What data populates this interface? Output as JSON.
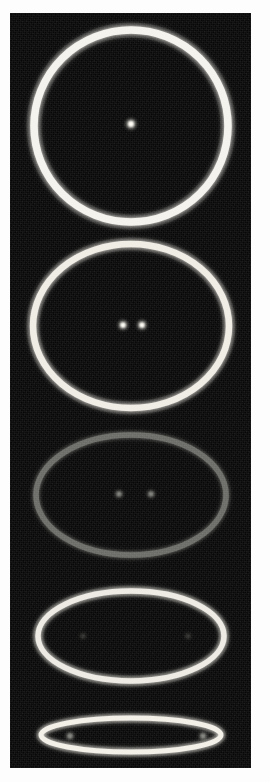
{
  "figure": {
    "kind": "photographic-plate",
    "panel_count": 5,
    "plate": {
      "x": 10,
      "y": 13,
      "width": 241,
      "height": 755,
      "background_color": "#070707",
      "border_color": "#101010",
      "page_color": "#fdfdfd"
    },
    "colors": {
      "bright_curve": "#f4f2ec",
      "dim_curve": "#8b8b86",
      "faint_curve": "#5d5d59",
      "bright_marker": "#fffdf4",
      "dim_marker": "#9a9a94",
      "faint_marker": "#4e4e4a",
      "plate_black": "#070707"
    }
  },
  "chart_data": {
    "type": "scatter",
    "title": "",
    "xlabel": "",
    "ylabel": "",
    "grid": false,
    "legend": null,
    "series": [
      {
        "name": "panel-1-circle",
        "shape": "circle",
        "eccentricity": 0.0,
        "center": [
          131,
          126
        ],
        "rx": 97,
        "ry": 96,
        "stroke_width": 7.5,
        "brightness": "bright",
        "curve_color": "#f4f2ec",
        "markers": [
          {
            "label": "center",
            "x": 131,
            "y": 124,
            "r": 3.4,
            "brightness": "bright"
          }
        ]
      },
      {
        "name": "panel-2-ellipse-low-e",
        "shape": "ellipse",
        "eccentricity": 0.55,
        "center": [
          131,
          326
        ],
        "rx": 98,
        "ry": 82,
        "stroke_width": 6.5,
        "brightness": "bright",
        "curve_color": "#efece4",
        "markers": [
          {
            "label": "focus-left",
            "x": 123,
            "y": 325,
            "r": 3.1,
            "brightness": "bright"
          },
          {
            "label": "focus-right",
            "x": 142,
            "y": 325,
            "r": 3.1,
            "brightness": "bright"
          }
        ]
      },
      {
        "name": "panel-3-ellipse-mid-e",
        "shape": "ellipse",
        "eccentricity": 0.78,
        "center": [
          131,
          495
        ],
        "rx": 95,
        "ry": 60,
        "stroke_width": 5.5,
        "brightness": "dim",
        "curve_color": "#8b8b86",
        "markers": [
          {
            "label": "focus-left",
            "x": 119,
            "y": 494,
            "r": 2.8,
            "brightness": "dim"
          },
          {
            "label": "focus-right",
            "x": 151,
            "y": 494,
            "r": 2.8,
            "brightness": "dim"
          }
        ]
      },
      {
        "name": "panel-4-ellipse-high-e",
        "shape": "ellipse",
        "eccentricity": 0.88,
        "center": [
          131,
          636
        ],
        "rx": 93,
        "ry": 45,
        "stroke_width": 5.5,
        "brightness": "bright",
        "curve_color": "#eceae2",
        "markers": [
          {
            "label": "focus-left",
            "x": 83,
            "y": 636,
            "r": 2.6,
            "brightness": "faint"
          },
          {
            "label": "focus-right",
            "x": 188,
            "y": 636,
            "r": 2.6,
            "brightness": "faint"
          }
        ]
      },
      {
        "name": "panel-5-ellipse-extreme-e",
        "shape": "ellipse",
        "eccentricity": 0.98,
        "center": [
          131,
          735
        ],
        "rx": 90,
        "ry": 17,
        "stroke_width": 5.0,
        "brightness": "bright",
        "curve_color": "#f2efe7",
        "markers": [
          {
            "label": "focus-left",
            "x": 70,
            "y": 736,
            "r": 3.0,
            "brightness": "dim"
          },
          {
            "label": "focus-right",
            "x": 203,
            "y": 736,
            "r": 3.0,
            "brightness": "dim"
          }
        ]
      }
    ]
  }
}
